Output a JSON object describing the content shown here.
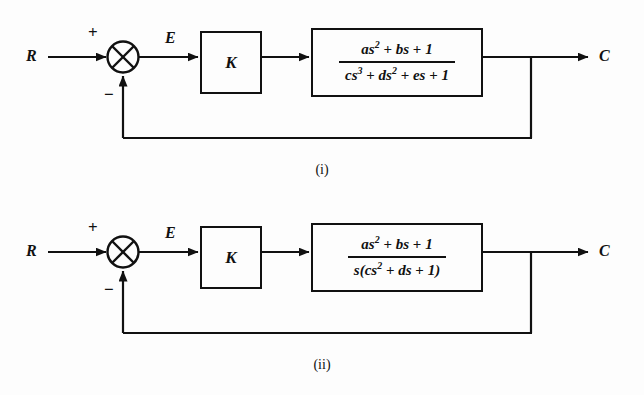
{
  "figure": {
    "background_color": "#fdfdfd",
    "line_color": "#111111",
    "diagrams": [
      {
        "caption": "(i)",
        "input_label": "R",
        "error_label": "E",
        "output_label": "C",
        "plus_sign": "+",
        "minus_sign": "−",
        "summing_junction": "crossed-circle",
        "gain_label": "K",
        "transfer_function": {
          "numerator": "as² + bs + 1",
          "denominator": "cs³ + ds² + es + 1",
          "numerator_parts": [
            {
              "base": "as",
              "exp": "2"
            },
            {
              "op": " + "
            },
            {
              "base": "bs",
              "exp": ""
            },
            {
              "op": " + "
            },
            {
              "base": "1",
              "exp": ""
            }
          ],
          "denominator_parts": [
            {
              "base": "cs",
              "exp": "3"
            },
            {
              "op": " + "
            },
            {
              "base": "ds",
              "exp": "2"
            },
            {
              "op": " + "
            },
            {
              "base": "es",
              "exp": ""
            },
            {
              "op": " + "
            },
            {
              "base": "1",
              "exp": ""
            }
          ]
        }
      },
      {
        "caption": "(ii)",
        "input_label": "R",
        "error_label": "E",
        "output_label": "C",
        "plus_sign": "+",
        "minus_sign": "−",
        "summing_junction": "crossed-circle",
        "gain_label": "K",
        "transfer_function": {
          "numerator": "as² + bs + 1",
          "denominator": "s(cs² + ds + 1)",
          "numerator_parts": [
            {
              "base": "as",
              "exp": "2"
            },
            {
              "op": " + "
            },
            {
              "base": "bs",
              "exp": ""
            },
            {
              "op": " + "
            },
            {
              "base": "1",
              "exp": ""
            }
          ],
          "denominator_parts": [
            {
              "base": "s(cs",
              "exp": "2"
            },
            {
              "op": " + "
            },
            {
              "base": "ds",
              "exp": ""
            },
            {
              "op": " + "
            },
            {
              "base": "1)",
              "exp": ""
            }
          ]
        }
      }
    ]
  }
}
